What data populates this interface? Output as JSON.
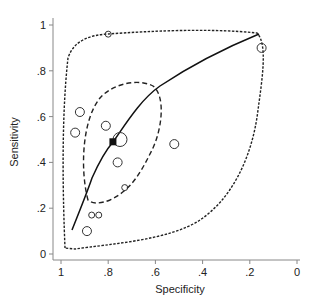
{
  "chart_data": {
    "type": "scatter",
    "title": "",
    "xlabel": "Specificity",
    "ylabel": "Sensitivity",
    "xlim": [
      1,
      0
    ],
    "ylim": [
      0,
      1
    ],
    "x_reversed": true,
    "grid": false,
    "x_ticks": [
      "1",
      ".8",
      ".6",
      ".4",
      ".2",
      "0"
    ],
    "y_ticks": [
      "0",
      ".2",
      ".4",
      ".6",
      ".8",
      "1"
    ],
    "series": [
      {
        "name": "Studies",
        "marker": "hollow-circle",
        "points": [
          {
            "spec": 0.8,
            "sens": 0.96,
            "size": "small"
          },
          {
            "spec": 0.15,
            "sens": 0.9,
            "size": "medium"
          },
          {
            "spec": 0.92,
            "sens": 0.62,
            "size": "medium"
          },
          {
            "spec": 0.94,
            "sens": 0.53,
            "size": "medium"
          },
          {
            "spec": 0.81,
            "sens": 0.56,
            "size": "medium"
          },
          {
            "spec": 0.75,
            "sens": 0.5,
            "size": "large"
          },
          {
            "spec": 0.76,
            "sens": 0.4,
            "size": "medium"
          },
          {
            "spec": 0.52,
            "sens": 0.48,
            "size": "medium"
          },
          {
            "spec": 0.73,
            "sens": 0.29,
            "size": "small"
          },
          {
            "spec": 0.87,
            "sens": 0.17,
            "size": "small"
          },
          {
            "spec": 0.84,
            "sens": 0.17,
            "size": "small"
          },
          {
            "spec": 0.89,
            "sens": 0.1,
            "size": "medium"
          }
        ]
      },
      {
        "name": "Summary point",
        "marker": "filled-square",
        "points": [
          {
            "spec": 0.78,
            "sens": 0.49
          }
        ]
      },
      {
        "name": "SROC curve",
        "style": "solid",
        "points": [
          {
            "spec": 0.96,
            "sens": 0.1
          },
          {
            "spec": 0.88,
            "sens": 0.28
          },
          {
            "spec": 0.78,
            "sens": 0.49
          },
          {
            "spec": 0.62,
            "sens": 0.72
          },
          {
            "spec": 0.4,
            "sens": 0.86
          },
          {
            "spec": 0.14,
            "sens": 0.97
          }
        ]
      },
      {
        "name": "95% confidence region",
        "style": "dashed"
      },
      {
        "name": "95% prediction region",
        "style": "dotted"
      }
    ]
  }
}
